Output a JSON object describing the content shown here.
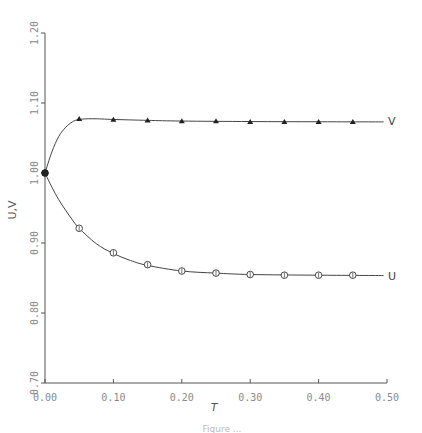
{
  "chart_data": {
    "type": "line",
    "title": "",
    "xlabel": "T",
    "ylabel": "U,V",
    "xlim": [
      0.0,
      0.5
    ],
    "ylim": [
      0.7,
      1.2
    ],
    "grid": false,
    "legend": "inline labels at right end of curves",
    "x_ticks": [
      "0.00",
      "0.10",
      "0.20",
      "0.30",
      "0.40",
      "0.50"
    ],
    "y_ticks": [
      "0.70",
      "0.80",
      "0.90",
      "1.00",
      "1.10",
      "1.20"
    ],
    "series": [
      {
        "name": "V",
        "marker": "triangle",
        "curve": [
          [
            0.0,
            1.0
          ],
          [
            0.01,
            1.03
          ],
          [
            0.02,
            1.052
          ],
          [
            0.03,
            1.065
          ],
          [
            0.04,
            1.073
          ],
          [
            0.05,
            1.0765
          ],
          [
            0.07,
            1.0775
          ],
          [
            0.1,
            1.0765
          ],
          [
            0.15,
            1.0752
          ],
          [
            0.2,
            1.0742
          ],
          [
            0.3,
            1.0735
          ],
          [
            0.4,
            1.0732
          ],
          [
            0.495,
            1.073
          ]
        ],
        "points": [
          [
            0.0,
            1.0
          ],
          [
            0.05,
            1.077
          ],
          [
            0.1,
            1.076
          ],
          [
            0.15,
            1.075
          ],
          [
            0.2,
            1.074
          ],
          [
            0.25,
            1.074
          ],
          [
            0.3,
            1.073
          ],
          [
            0.35,
            1.073
          ],
          [
            0.4,
            1.073
          ],
          [
            0.45,
            1.073
          ]
        ]
      },
      {
        "name": "U",
        "marker": "circle",
        "curve": [
          [
            0.0,
            1.0
          ],
          [
            0.01,
            0.98
          ],
          [
            0.02,
            0.962
          ],
          [
            0.03,
            0.947
          ],
          [
            0.04,
            0.933
          ],
          [
            0.05,
            0.921
          ],
          [
            0.075,
            0.899
          ],
          [
            0.1,
            0.885
          ],
          [
            0.125,
            0.875
          ],
          [
            0.15,
            0.868
          ],
          [
            0.2,
            0.86
          ],
          [
            0.25,
            0.857
          ],
          [
            0.3,
            0.855
          ],
          [
            0.4,
            0.854
          ],
          [
            0.495,
            0.8535
          ]
        ],
        "points": [
          [
            0.0,
            1.0
          ],
          [
            0.05,
            0.921
          ],
          [
            0.1,
            0.886
          ],
          [
            0.15,
            0.869
          ],
          [
            0.2,
            0.86
          ],
          [
            0.25,
            0.857
          ],
          [
            0.3,
            0.855
          ],
          [
            0.35,
            0.854
          ],
          [
            0.4,
            0.854
          ],
          [
            0.45,
            0.854
          ]
        ]
      }
    ]
  },
  "labels": {
    "xlabel": "T",
    "ylabel": "U,V",
    "v_series": "V",
    "u_series": "U",
    "caption": "Figure ..."
  },
  "colors": {
    "axis": "#555555",
    "curve": "#444444",
    "tick_text": "#8a8a8a"
  }
}
